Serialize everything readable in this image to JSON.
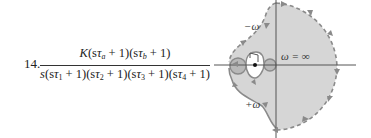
{
  "problem": {
    "number": "14.",
    "transfer_function": {
      "numerator": "K(sτa + 1)(sτb + 1)",
      "numerator_parts": {
        "K": "K",
        "open1": "(s",
        "tau_a": "τ",
        "sub_a": "a",
        "close1": " + 1)",
        "open2": "(s",
        "tau_b": "τ",
        "sub_b": "b",
        "close2": " + 1)"
      },
      "denominator": "s(sτ1 + 1)(sτ2 + 1)(sτ3 + 1)(sτ4 + 1)",
      "denominator_parts": {
        "s": "s",
        "terms": [
          {
            "open": "(s",
            "tau": "τ",
            "sub": "1",
            "close": " + 1)"
          },
          {
            "open": "(s",
            "tau": "τ",
            "sub": "2",
            "close": " + 1)"
          },
          {
            "open": "(s",
            "tau": "τ",
            "sub": "3",
            "close": " + 1)"
          },
          {
            "open": "(s",
            "tau": "τ",
            "sub": "4",
            "close": " + 1)"
          }
        ]
      }
    }
  },
  "nyquist_plot": {
    "labels": {
      "neg_omega": "−ω",
      "pos_omega": "+ω",
      "omega_inf": "ω = ∞"
    },
    "colors": {
      "fill": "#d6d6d6",
      "curve": "#8a8a8a",
      "axis": "#555555",
      "bulge_fill": "#b8b8b8"
    }
  }
}
